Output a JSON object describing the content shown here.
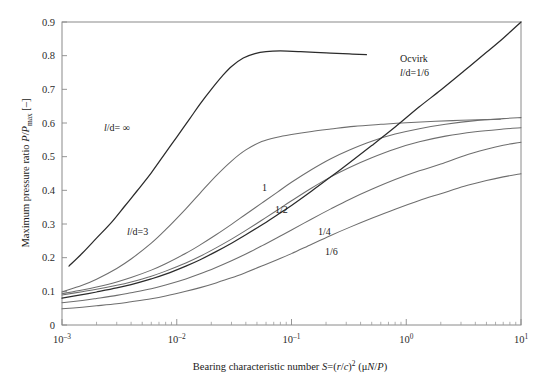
{
  "figure": {
    "background_color": "#ffffff",
    "curve_color": "#6e6e6e",
    "dark_curve_color": "#2b2b2b",
    "axis_color": "#8a8a8a"
  },
  "chart_data": {
    "type": "line",
    "title": "",
    "xlabel_parts": {
      "lead": "Bearing characteristic number ",
      "sym": "S",
      "eq": "=(",
      "r": "r",
      "slash": "/",
      "c": "c",
      "close": ")",
      "exp": "2",
      "units_open": " (μ",
      "n": "N",
      "slash2": "/",
      "p": "P",
      "units_close": ")"
    },
    "xlabel": "Bearing characteristic number S=(r/c)2 (μN/P)",
    "ylabel_parts": {
      "lead": "Maximum pressure ratio ",
      "p1": "P",
      "slash": "/",
      "p2": "P",
      "sub": "max",
      "units": " [–]"
    },
    "ylabel": "Maximum pressure ratio P/Pmax [–]",
    "xscale": "log",
    "xlim": [
      0.001,
      10
    ],
    "ylim": [
      0,
      0.9
    ],
    "grid": false,
    "legend_position": "inline-annotations",
    "xticks": [
      {
        "value": 0.001,
        "mantissa": "10",
        "exponent": "–3"
      },
      {
        "value": 0.01,
        "mantissa": "10",
        "exponent": "–2"
      },
      {
        "value": 0.1,
        "mantissa": "10",
        "exponent": "–1"
      },
      {
        "value": 1,
        "mantissa": "10",
        "exponent": "0"
      },
      {
        "value": 10,
        "mantissa": "10",
        "exponent": "1"
      }
    ],
    "yticks": [
      {
        "value": 0,
        "label": "0"
      },
      {
        "value": 0.1,
        "label": "0.1"
      },
      {
        "value": 0.2,
        "label": "0.2"
      },
      {
        "value": 0.3,
        "label": "0.3"
      },
      {
        "value": 0.4,
        "label": "0.4"
      },
      {
        "value": 0.5,
        "label": "0.5"
      },
      {
        "value": 0.6,
        "label": "0.6"
      },
      {
        "value": 0.7,
        "label": "0.7"
      },
      {
        "value": 0.8,
        "label": "0.8"
      },
      {
        "value": 0.9,
        "label": "0.9"
      }
    ],
    "annotations": [
      {
        "id": "ann-ld-inf",
        "text": "l/d= ∞",
        "italic_head": "l",
        "rest": "/d= ∞",
        "x_px": 104,
        "y_px": 131
      },
      {
        "id": "ann-ld-3",
        "text": "l/d=3",
        "italic_head": "l",
        "rest": "/d=3",
        "x_px": 127,
        "y_px": 235
      },
      {
        "id": "ann-ocvirk",
        "text": "Ocvirk",
        "x_px": 400,
        "y_px": 62
      },
      {
        "id": "ann-ocvirk-ld",
        "text": "l/d=1/6",
        "italic_head": "l",
        "rest": "/d=1/6",
        "x_px": 400,
        "y_px": 76
      },
      {
        "id": "ann-1",
        "text": "1",
        "x_px": 262,
        "y_px": 191
      },
      {
        "id": "ann-1-2",
        "text": "1/2",
        "x_px": 275,
        "y_px": 213
      },
      {
        "id": "ann-1-4",
        "text": "1/4",
        "x_px": 318,
        "y_px": 235
      },
      {
        "id": "ann-1-6",
        "text": "1/6",
        "x_px": 325,
        "y_px": 255
      }
    ],
    "series": [
      {
        "name": "l/d = ∞",
        "style": "dark",
        "points": [
          [
            0.00115,
            0.175
          ],
          [
            0.0015,
            0.213
          ],
          [
            0.002,
            0.258
          ],
          [
            0.0027,
            0.305
          ],
          [
            0.0035,
            0.352
          ],
          [
            0.0045,
            0.398
          ],
          [
            0.006,
            0.452
          ],
          [
            0.008,
            0.512
          ],
          [
            0.01,
            0.558
          ],
          [
            0.013,
            0.613
          ],
          [
            0.016,
            0.657
          ],
          [
            0.02,
            0.7
          ],
          [
            0.025,
            0.74
          ],
          [
            0.03,
            0.768
          ],
          [
            0.038,
            0.793
          ],
          [
            0.048,
            0.806
          ],
          [
            0.06,
            0.812
          ],
          [
            0.08,
            0.814
          ],
          [
            0.12,
            0.812
          ],
          [
            0.2,
            0.808
          ],
          [
            0.32,
            0.805
          ],
          [
            0.45,
            0.803
          ]
        ]
      },
      {
        "name": "l/d = 3",
        "style": "light",
        "points": [
          [
            0.001,
            0.098
          ],
          [
            0.0015,
            0.118
          ],
          [
            0.002,
            0.136
          ],
          [
            0.003,
            0.168
          ],
          [
            0.004,
            0.196
          ],
          [
            0.006,
            0.243
          ],
          [
            0.008,
            0.283
          ],
          [
            0.012,
            0.345
          ],
          [
            0.016,
            0.392
          ],
          [
            0.022,
            0.443
          ],
          [
            0.03,
            0.487
          ],
          [
            0.04,
            0.52
          ],
          [
            0.055,
            0.545
          ],
          [
            0.075,
            0.558
          ],
          [
            0.1,
            0.566
          ],
          [
            0.15,
            0.575
          ],
          [
            0.22,
            0.582
          ],
          [
            0.35,
            0.59
          ],
          [
            0.6,
            0.596
          ],
          [
            1.0,
            0.601
          ],
          [
            1.8,
            0.605
          ],
          [
            3.0,
            0.608
          ],
          [
            5.0,
            0.61
          ],
          [
            6.6,
            0.611
          ]
        ]
      },
      {
        "name": "l/d = 1",
        "style": "light",
        "points": [
          [
            0.001,
            0.093
          ],
          [
            0.0015,
            0.104
          ],
          [
            0.002,
            0.113
          ],
          [
            0.003,
            0.128
          ],
          [
            0.004,
            0.141
          ],
          [
            0.006,
            0.163
          ],
          [
            0.008,
            0.182
          ],
          [
            0.012,
            0.213
          ],
          [
            0.016,
            0.238
          ],
          [
            0.022,
            0.268
          ],
          [
            0.03,
            0.299
          ],
          [
            0.04,
            0.329
          ],
          [
            0.055,
            0.362
          ],
          [
            0.075,
            0.394
          ],
          [
            0.1,
            0.424
          ],
          [
            0.15,
            0.462
          ],
          [
            0.22,
            0.494
          ],
          [
            0.32,
            0.52
          ],
          [
            0.5,
            0.546
          ],
          [
            0.8,
            0.567
          ],
          [
            1.3,
            0.583
          ],
          [
            2.2,
            0.596
          ],
          [
            4.0,
            0.607
          ],
          [
            7.0,
            0.613
          ],
          [
            10,
            0.616
          ]
        ]
      },
      {
        "name": "l/d = 1/2",
        "style": "light",
        "points": [
          [
            0.001,
            0.089
          ],
          [
            0.0015,
            0.099
          ],
          [
            0.002,
            0.106
          ],
          [
            0.003,
            0.118
          ],
          [
            0.004,
            0.128
          ],
          [
            0.006,
            0.145
          ],
          [
            0.008,
            0.16
          ],
          [
            0.012,
            0.184
          ],
          [
            0.016,
            0.204
          ],
          [
            0.022,
            0.229
          ],
          [
            0.03,
            0.255
          ],
          [
            0.04,
            0.281
          ],
          [
            0.055,
            0.311
          ],
          [
            0.075,
            0.341
          ],
          [
            0.1,
            0.369
          ],
          [
            0.15,
            0.407
          ],
          [
            0.22,
            0.44
          ],
          [
            0.32,
            0.468
          ],
          [
            0.5,
            0.497
          ],
          [
            0.8,
            0.523
          ],
          [
            1.3,
            0.544
          ],
          [
            2.2,
            0.561
          ],
          [
            4.0,
            0.574
          ],
          [
            7.0,
            0.582
          ],
          [
            10,
            0.586
          ]
        ]
      },
      {
        "name": "Ocvirk l/d = 1/6",
        "style": "dark",
        "points": [
          [
            0.001,
            0.08
          ],
          [
            0.0015,
            0.09
          ],
          [
            0.002,
            0.098
          ],
          [
            0.003,
            0.11
          ],
          [
            0.004,
            0.12
          ],
          [
            0.006,
            0.137
          ],
          [
            0.008,
            0.151
          ],
          [
            0.012,
            0.175
          ],
          [
            0.016,
            0.194
          ],
          [
            0.022,
            0.218
          ],
          [
            0.03,
            0.243
          ],
          [
            0.04,
            0.268
          ],
          [
            0.055,
            0.297
          ],
          [
            0.075,
            0.327
          ],
          [
            0.1,
            0.355
          ],
          [
            0.15,
            0.398
          ],
          [
            0.22,
            0.44
          ],
          [
            0.32,
            0.482
          ],
          [
            0.5,
            0.533
          ],
          [
            0.8,
            0.588
          ],
          [
            1.3,
            0.648
          ],
          [
            2.0,
            0.698
          ],
          [
            3.2,
            0.755
          ],
          [
            5.0,
            0.81
          ],
          [
            7.0,
            0.852
          ],
          [
            10,
            0.9
          ]
        ]
      },
      {
        "name": "l/d = 1/4",
        "style": "light",
        "points": [
          [
            0.001,
            0.066
          ],
          [
            0.0015,
            0.073
          ],
          [
            0.002,
            0.079
          ],
          [
            0.003,
            0.088
          ],
          [
            0.004,
            0.096
          ],
          [
            0.006,
            0.108
          ],
          [
            0.008,
            0.119
          ],
          [
            0.012,
            0.137
          ],
          [
            0.016,
            0.152
          ],
          [
            0.022,
            0.171
          ],
          [
            0.03,
            0.191
          ],
          [
            0.04,
            0.211
          ],
          [
            0.055,
            0.235
          ],
          [
            0.075,
            0.259
          ],
          [
            0.1,
            0.282
          ],
          [
            0.15,
            0.315
          ],
          [
            0.22,
            0.345
          ],
          [
            0.32,
            0.373
          ],
          [
            0.5,
            0.403
          ],
          [
            0.8,
            0.432
          ],
          [
            1.3,
            0.458
          ],
          [
            2.0,
            0.478
          ],
          [
            3.2,
            0.503
          ],
          [
            5.0,
            0.522
          ],
          [
            7.0,
            0.534
          ],
          [
            10,
            0.543
          ]
        ]
      },
      {
        "name": "l/d = 1/6",
        "style": "light",
        "points": [
          [
            0.001,
            0.048
          ],
          [
            0.0015,
            0.053
          ],
          [
            0.002,
            0.057
          ],
          [
            0.003,
            0.063
          ],
          [
            0.004,
            0.069
          ],
          [
            0.006,
            0.078
          ],
          [
            0.008,
            0.086
          ],
          [
            0.012,
            0.1
          ],
          [
            0.016,
            0.111
          ],
          [
            0.022,
            0.125
          ],
          [
            0.03,
            0.14
          ],
          [
            0.04,
            0.156
          ],
          [
            0.055,
            0.175
          ],
          [
            0.075,
            0.194
          ],
          [
            0.1,
            0.212
          ],
          [
            0.15,
            0.24
          ],
          [
            0.22,
            0.266
          ],
          [
            0.32,
            0.29
          ],
          [
            0.5,
            0.317
          ],
          [
            0.8,
            0.344
          ],
          [
            1.3,
            0.37
          ],
          [
            2.0,
            0.39
          ],
          [
            3.2,
            0.412
          ],
          [
            5.0,
            0.429
          ],
          [
            7.0,
            0.44
          ],
          [
            10,
            0.449
          ]
        ]
      }
    ]
  }
}
